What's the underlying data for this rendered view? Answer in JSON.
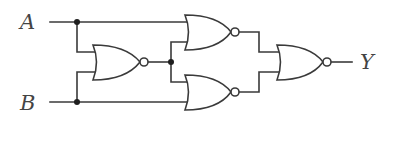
{
  "diagram": {
    "type": "logic-circuit",
    "inputs": [
      {
        "id": "A",
        "label": "A"
      },
      {
        "id": "B",
        "label": "B"
      }
    ],
    "outputs": [
      {
        "id": "Y",
        "label": "Y"
      }
    ],
    "gates": [
      {
        "id": "G1",
        "type": "NOR",
        "inputs": [
          "A",
          "B"
        ]
      },
      {
        "id": "G2",
        "type": "NOR",
        "inputs": [
          "A",
          "G1"
        ]
      },
      {
        "id": "G3",
        "type": "NOR",
        "inputs": [
          "G1",
          "B"
        ]
      },
      {
        "id": "G4",
        "type": "NOR",
        "inputs": [
          "G2",
          "G3"
        ],
        "output": "Y"
      }
    ],
    "junctions": [
      "A",
      "B",
      "G1"
    ],
    "colors": {
      "line": "#3a3a3a",
      "label": "#444444",
      "background": "#ffffff"
    }
  }
}
